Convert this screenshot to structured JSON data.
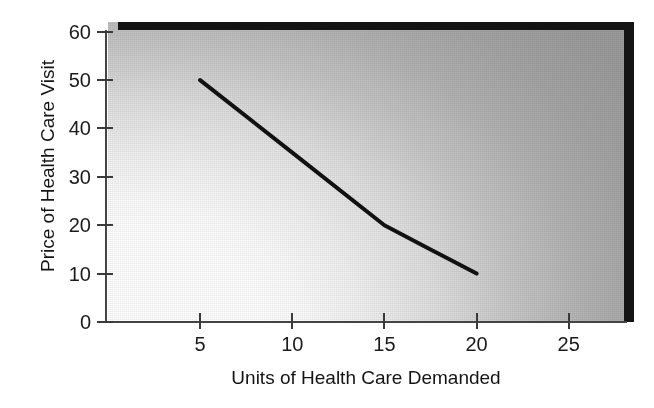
{
  "chart_data": {
    "type": "line",
    "title": "",
    "xlabel": "Units of Health Care Demanded",
    "ylabel": "Price of Health Care Visit",
    "xlim": [
      0,
      28
    ],
    "ylim": [
      0,
      62
    ],
    "xticks": [
      5,
      10,
      15,
      20,
      25
    ],
    "xtick_labels": [
      "5",
      "10",
      "15",
      "20",
      "25"
    ],
    "yticks": [
      0,
      10,
      20,
      30,
      40,
      50,
      60
    ],
    "ytick_labels": [
      "0",
      "10",
      "20",
      "30",
      "40",
      "50",
      "60"
    ],
    "grid": false,
    "legend": null,
    "series": [
      {
        "name": "Demand",
        "x": [
          5,
          10,
          15,
          17.5,
          20
        ],
        "values": [
          50,
          35,
          20,
          15,
          10
        ],
        "color": "#111111",
        "line_width": 4
      }
    ],
    "annotations": [],
    "background": {
      "fill_description": "gradient shading from white at lower-left to gray at upper-right",
      "gradient_light": "#ffffff",
      "gradient_dark": "#9b9b9b",
      "border_top_color": "#131313",
      "border_right_color": "#141414"
    },
    "axis_color": "#444444",
    "text_color": "#1b1b1b"
  }
}
